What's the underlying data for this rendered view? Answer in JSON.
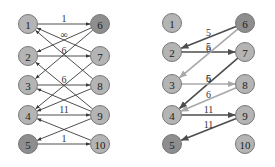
{
  "colors": {
    "node_fill": "#b4b4b4",
    "node_fill_terminal": "#8e8e8e",
    "node_stroke": "#777777",
    "edge_dark": "#4d4d4d",
    "edge_light": "#a8a8a8",
    "edge_left": "#3a3a3a"
  },
  "graphs": [
    {
      "name": "original-network",
      "nodes": [
        {
          "id": "1",
          "side": "left",
          "row": 0,
          "terminal": false
        },
        {
          "id": "2",
          "side": "left",
          "row": 1,
          "terminal": false
        },
        {
          "id": "3",
          "side": "left",
          "row": 2,
          "terminal": false
        },
        {
          "id": "4",
          "side": "left",
          "row": 3,
          "terminal": false
        },
        {
          "id": "5",
          "side": "left",
          "row": 4,
          "terminal": true
        },
        {
          "id": "6",
          "side": "right",
          "row": 0,
          "terminal": true
        },
        {
          "id": "7",
          "side": "right",
          "row": 1,
          "terminal": false
        },
        {
          "id": "8",
          "side": "right",
          "row": 2,
          "terminal": false
        },
        {
          "id": "9",
          "side": "right",
          "row": 3,
          "terminal": false
        },
        {
          "id": "10",
          "side": "right",
          "row": 4,
          "terminal": false
        }
      ],
      "edges": [
        {
          "from": "1",
          "to": "6",
          "label": "1",
          "style": "left"
        },
        {
          "from": "6",
          "to": "2",
          "label": "∞",
          "style": "left"
        },
        {
          "from": "7",
          "to": "1",
          "label": "",
          "style": "left"
        },
        {
          "from": "8",
          "to": "1",
          "label": "",
          "style": "left"
        },
        {
          "from": "2",
          "to": "7",
          "label": "6",
          "style": "left"
        },
        {
          "from": "6",
          "to": "3",
          "label": "",
          "style": "left"
        },
        {
          "from": "9",
          "to": "2",
          "label": "",
          "style": "left"
        },
        {
          "from": "3",
          "to": "8",
          "label": "6",
          "style": "left"
        },
        {
          "from": "7",
          "to": "4",
          "label": "",
          "style": "left"
        },
        {
          "from": "8",
          "to": "4",
          "label": "",
          "style": "left"
        },
        {
          "from": "9",
          "to": "3",
          "label": "",
          "style": "left"
        },
        {
          "from": "4",
          "to": "9",
          "label": "11",
          "style": "left"
        },
        {
          "from": "9",
          "to": "5",
          "label": "",
          "style": "left"
        },
        {
          "from": "10",
          "to": "4",
          "label": "",
          "style": "left"
        },
        {
          "from": "5",
          "to": "10",
          "label": "1",
          "style": "left"
        }
      ]
    },
    {
      "name": "flow-solution",
      "nodes": [
        {
          "id": "1",
          "side": "left",
          "row": 0,
          "terminal": false
        },
        {
          "id": "2",
          "side": "left",
          "row": 1,
          "terminal": false
        },
        {
          "id": "3",
          "side": "left",
          "row": 2,
          "terminal": false
        },
        {
          "id": "4",
          "side": "left",
          "row": 3,
          "terminal": false
        },
        {
          "id": "5",
          "side": "left",
          "row": 4,
          "terminal": true
        },
        {
          "id": "6",
          "side": "right",
          "row": 0,
          "terminal": true
        },
        {
          "id": "7",
          "side": "right",
          "row": 1,
          "terminal": false
        },
        {
          "id": "8",
          "side": "right",
          "row": 2,
          "terminal": false
        },
        {
          "id": "9",
          "side": "right",
          "row": 3,
          "terminal": false
        },
        {
          "id": "10",
          "side": "right",
          "row": 4,
          "terminal": false
        }
      ],
      "edges": [
        {
          "from": "6",
          "to": "2",
          "label": "5",
          "style": "dark"
        },
        {
          "from": "2",
          "to": "7",
          "label": "5",
          "style": "dark"
        },
        {
          "from": "6",
          "to": "3",
          "label": "6",
          "style": "light"
        },
        {
          "from": "7",
          "to": "4",
          "label": "5",
          "style": "dark"
        },
        {
          "from": "3",
          "to": "8",
          "label": "6",
          "style": "light"
        },
        {
          "from": "8",
          "to": "4",
          "label": "6",
          "style": "light"
        },
        {
          "from": "4",
          "to": "9",
          "label": "11",
          "style": "dark"
        },
        {
          "from": "9",
          "to": "5",
          "label": "11",
          "style": "dark"
        }
      ]
    }
  ]
}
